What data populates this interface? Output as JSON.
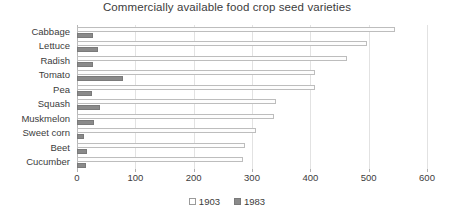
{
  "chart_data": {
    "type": "bar",
    "orientation": "horizontal",
    "title": "Commercially available food crop seed varieties",
    "xlabel": "",
    "ylabel": "",
    "categories": [
      "Cabbage",
      "Lettuce",
      "Radish",
      "Tomato",
      "Pea",
      "Squash",
      "Muskmelon",
      "Sweet corn",
      "Beet",
      "Cucumber"
    ],
    "series": [
      {
        "name": "1903",
        "values": [
          545,
          497,
          463,
          408,
          408,
          341,
          338,
          307,
          288,
          285
        ],
        "color": "#ffffff"
      },
      {
        "name": "1983",
        "values": [
          28,
          36,
          27,
          79,
          25,
          40,
          29,
          12,
          17,
          16
        ],
        "color": "#8a8a8a"
      }
    ],
    "xlim": [
      0,
      600
    ],
    "xticks": [
      0,
      100,
      200,
      300,
      400,
      500,
      600
    ],
    "xtick_labels": [
      "0",
      "100",
      "200",
      "300",
      "400",
      "500",
      "600"
    ],
    "grid": "vertical",
    "legend_position": "bottom-center",
    "legend_entries": [
      "1903",
      "1983"
    ]
  }
}
